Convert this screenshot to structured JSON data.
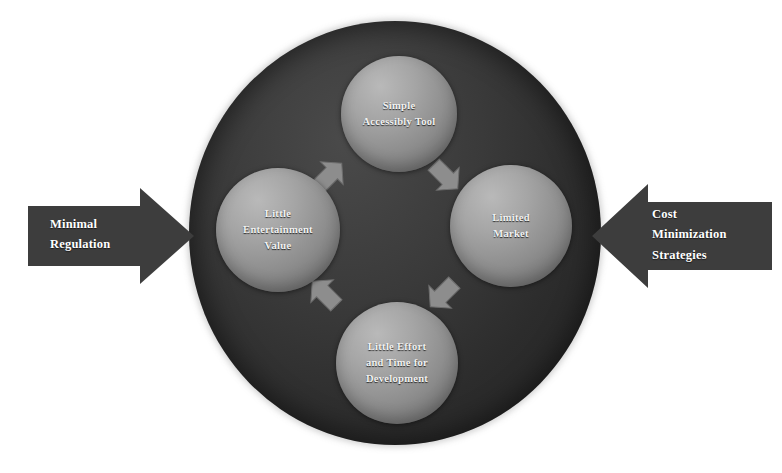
{
  "diagram": {
    "background_color": "#ffffff",
    "outer_disc": {
      "name": "outer-dark-disc",
      "color": "#333333"
    },
    "nodes": [
      {
        "id": "simple-accessibly-tool",
        "label": "Simple\nAccessibly Tool",
        "position": "top",
        "color": "#9a9a9a"
      },
      {
        "id": "limited-market",
        "label": "Limited\nMarket",
        "position": "right",
        "color": "#9a9a9a"
      },
      {
        "id": "little-effort-and-time-for-development",
        "label": "Little Effort\nand Time for\nDevelopment",
        "position": "bottom",
        "color": "#9a9a9a"
      },
      {
        "id": "little-entertainment-value",
        "label": "Little\nEntertainment\nValue",
        "position": "left",
        "color": "#9a9a9a"
      }
    ],
    "cycle_arrows": [
      {
        "id": "arrow-left-to-top",
        "direction": "up-right",
        "from": "little-entertainment-value",
        "to": "simple-accessibly-tool"
      },
      {
        "id": "arrow-top-to-right",
        "direction": "down-right",
        "from": "simple-accessibly-tool",
        "to": "limited-market"
      },
      {
        "id": "arrow-right-to-bottom",
        "direction": "down-left",
        "from": "limited-market",
        "to": "little-effort-and-time-for-development"
      },
      {
        "id": "arrow-bottom-to-left",
        "direction": "up-left",
        "from": "little-effort-and-time-for-development",
        "to": "little-entertainment-value"
      }
    ],
    "side_arrows": [
      {
        "id": "minimal-regulation",
        "label": "Minimal\nRegulation",
        "direction": "right",
        "side": "left",
        "color": "#3d3d3d"
      },
      {
        "id": "cost-minimization-strategies",
        "label": "Cost\nMinimization\nStrategies",
        "direction": "left",
        "side": "right",
        "color": "#3d3d3d"
      }
    ]
  }
}
